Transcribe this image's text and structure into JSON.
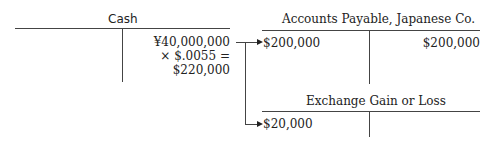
{
  "accounts": {
    "cash": {
      "title": "Cash",
      "credit_lines": [
        "¥40,000,000",
        "× $.0055 =",
        "$220,000"
      ]
    },
    "accounts_payable": {
      "title": "Accounts Payable, Japanese Co.",
      "debit": "$200,000",
      "credit": "$200,000"
    },
    "exchange": {
      "title": "Exchange Gain or Loss",
      "debit": "$20,000"
    }
  }
}
